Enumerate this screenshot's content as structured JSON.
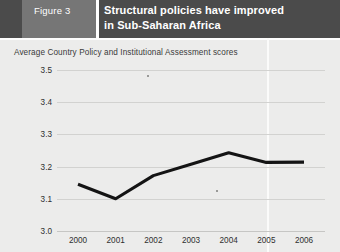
{
  "header": {
    "figure_tag": "Figure 3",
    "title_line1": "Structural policies have improved",
    "title_line2": "in Sub-Saharan Africa",
    "band_color": "#4b4b4b",
    "tag_color": "#767676",
    "text_color": "#ffffff"
  },
  "panel": {
    "background": "#ececeb"
  },
  "chart_data": {
    "type": "line",
    "title": "Structural policies have improved in Sub-Saharan Africa",
    "subtitle": "Average Country Policy and Institutional Assessment scores",
    "xlabel": "",
    "ylabel": "",
    "categories": [
      "2000",
      "2001",
      "2002",
      "2003",
      "2004",
      "2005",
      "2006"
    ],
    "values": [
      3.145,
      3.1,
      3.172,
      3.207,
      3.243,
      3.213,
      3.214
    ],
    "ylim": [
      3.0,
      3.5
    ],
    "yticks": [
      "3.0",
      "3.1",
      "3.2",
      "3.3",
      "3.4",
      "3.5"
    ],
    "ytick_values": [
      3.0,
      3.1,
      3.2,
      3.3,
      3.4,
      3.5
    ],
    "xticks": [
      "2000",
      "2001",
      "2002",
      "2003",
      "2004",
      "2005",
      "2006"
    ],
    "grid": true,
    "legend": "none",
    "series": [
      {
        "name": "Average CPIA score",
        "color": "#141414",
        "values": [
          3.145,
          3.1,
          3.172,
          3.207,
          3.243,
          3.213,
          3.214
        ]
      }
    ]
  }
}
